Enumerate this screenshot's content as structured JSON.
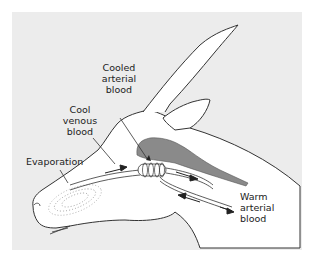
{
  "diagram": {
    "title": "",
    "colors": {
      "background_panel": "#ececec",
      "animal_fill": "#ffffff",
      "outline": "#333333",
      "brain_fill": "#8a8a8a",
      "stipple": "#555555"
    },
    "labels": {
      "cooled_arterial": [
        "Cooled",
        "arterial",
        "blood"
      ],
      "cool_venous": [
        "Cool",
        "venous",
        "blood"
      ],
      "evaporation": "Evaporation",
      "warm_arterial": [
        "Warm",
        "arterial",
        "blood"
      ]
    }
  }
}
